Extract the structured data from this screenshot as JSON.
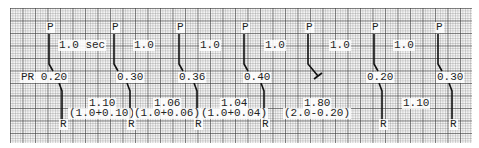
{
  "diagram": {
    "type": "ecg-ladder-diagram",
    "colors": {
      "grid_major": "#595959",
      "grid_minor": "#9a9a9a",
      "trace": "#111111",
      "paper": "#f4f4f4"
    },
    "p_label": "P",
    "r_label": "R",
    "pp_labels": [
      {
        "text": "1.0 sec",
        "x": 58,
        "y": 40
      },
      {
        "text": "1.0",
        "x": 133,
        "y": 40
      },
      {
        "text": "1.0",
        "x": 199,
        "y": 40
      },
      {
        "text": "1.0",
        "x": 264,
        "y": 40
      },
      {
        "text": "1.0",
        "x": 329,
        "y": 40
      },
      {
        "text": "1.0",
        "x": 393,
        "y": 40
      }
    ],
    "beats": [
      {
        "p_x": 47,
        "pr_text": "PR 0.20",
        "pr_x": 20,
        "conducted": true,
        "r_x": 62
      },
      {
        "p_x": 112,
        "pr_text": "0.30",
        "pr_x": 116,
        "conducted": true,
        "r_x": 130
      },
      {
        "p_x": 177,
        "pr_text": "0.36",
        "pr_x": 178,
        "conducted": true,
        "r_x": 197
      },
      {
        "p_x": 242,
        "pr_text": "0.40",
        "pr_x": 243,
        "conducted": true,
        "r_x": 264
      },
      {
        "p_x": 306,
        "pr_text": "",
        "pr_x": 0,
        "conducted": false,
        "r_x": null
      },
      {
        "p_x": 372,
        "pr_text": "0.20",
        "pr_x": 366,
        "conducted": true,
        "r_x": 382
      },
      {
        "p_x": 436,
        "pr_text": "0.30",
        "pr_x": 436,
        "conducted": true,
        "r_x": 452
      }
    ],
    "rr_labels": [
      {
        "value": "1.10",
        "formula": "(1.0+0.10)",
        "x": 88,
        "fx": 68
      },
      {
        "value": "1.06",
        "formula": "(1.0+0.06)",
        "x": 153,
        "fx": 133
      },
      {
        "value": "1.04",
        "formula": "(1.0+0.04)",
        "x": 220,
        "fx": 200
      },
      {
        "value": "1.80",
        "formula": "(2.0-0.20)",
        "x": 303,
        "fx": 283
      },
      {
        "value": "1.10",
        "formula": "",
        "x": 402,
        "fx": 0
      }
    ]
  }
}
